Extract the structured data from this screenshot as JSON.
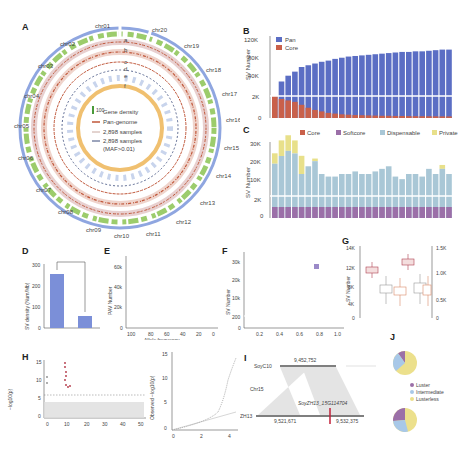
{
  "panels": {
    "A": {
      "label": "A",
      "chromosomes": [
        "chr01",
        "chr02",
        "chr03",
        "chr04",
        "chr05",
        "chr06",
        "chr07",
        "chr08",
        "chr09",
        "chr10",
        "chr11",
        "chr12",
        "chr13",
        "chr14",
        "chr15",
        "chr16",
        "chr17",
        "chr18",
        "chr19",
        "chr20"
      ],
      "track_labels": [
        "a",
        "b",
        "c",
        "d",
        "e",
        "f"
      ],
      "legend": [
        {
          "label": "Gene density",
          "scale_max": "100",
          "scale_min": "0"
        },
        {
          "label": "Pan-genome",
          "color": "#c0573a"
        },
        {
          "label": "2,898 samples",
          "color": "#c8a8a0"
        },
        {
          "label": "2,898 samples (MAF>0.01)",
          "color": "#3a4a7a"
        }
      ],
      "colors": {
        "outer_ring": "#8fa6e0",
        "gene_density": "#4a9a3a",
        "inner_ring": "#f0c070"
      }
    },
    "B": {
      "label": "B"
    },
    "C": {
      "label": "C"
    },
    "D": {
      "label": "D"
    },
    "E": {
      "label": "E"
    },
    "F": {
      "label": "F"
    },
    "G": {
      "label": "G"
    },
    "H": {
      "label": "H"
    },
    "I": {
      "label": "I",
      "top_genome": "SoyC10",
      "top_position": "9,452,752",
      "chr": "Chr15",
      "bottom_genome": "ZH13",
      "gene": "SoyZH13_15G114704",
      "bottom_start": "9,521,671",
      "bottom_end": "9,532,375"
    },
    "J": {
      "label": "J",
      "legend": [
        "Luster",
        "Intermediate",
        "Lusterless"
      ],
      "colors": [
        "#9b6fa8",
        "#a8c8e8",
        "#ece08c"
      ]
    }
  },
  "chart_data": [
    {
      "id": "B",
      "type": "bar",
      "title": "",
      "xlabel": "",
      "ylabel": "SV Number",
      "yticks": [
        "0",
        "2K",
        "40K",
        "80K",
        "120K"
      ],
      "legend": [
        "Pan",
        "Core"
      ],
      "colors": {
        "Pan": "#5b6ec4",
        "Core": "#c9604a"
      },
      "series": [
        {
          "name": "Pan",
          "values": [
            3,
            45,
            55,
            62,
            70,
            73,
            76,
            79,
            81,
            84,
            86,
            88,
            89,
            90,
            91,
            92,
            93,
            94,
            95,
            96,
            96,
            97,
            97,
            98,
            99,
            100,
            100
          ]
        },
        {
          "name": "Core",
          "values": [
            3,
            2.6,
            2.4,
            2.2,
            1.8,
            1.4,
            1.1,
            0.9,
            0.7,
            0.6,
            0.5,
            0.45,
            0.4,
            0.38,
            0.35,
            0.33,
            0.3,
            0.3,
            0.28,
            0.27,
            0.26,
            0.25,
            0.24,
            0.24,
            0.23,
            0.22,
            0.22
          ]
        }
      ],
      "note": "broken y-axis: 0-3K lower segment, 20K-120K upper segment; values in K"
    },
    {
      "id": "C",
      "type": "bar",
      "stacked": true,
      "ylabel": "SV Number",
      "yticks": [
        "0",
        "2K",
        "10K",
        "20K",
        "30K"
      ],
      "legend": [
        "Core",
        "Softcore",
        "Dispensable",
        "Private"
      ],
      "colors": {
        "Core": "#c9604a",
        "Softcore": "#9b6fa8",
        "Dispensable": "#a9c7d6",
        "Private": "#e8e08a"
      },
      "categories": [
        "SoyW01",
        "SoyW02",
        "SoyW03",
        "SoyW04",
        "SoyW05",
        "SoyL01",
        "SoyL02",
        "SoyL03",
        "SoyL04",
        "SoyL05",
        "SoyL06",
        "SoyL07",
        "SoyL08",
        "SoyL09",
        "SoyC01",
        "SoyC02",
        "SoyC03",
        "SoyC04",
        "SoyC05",
        "SoyC06",
        "SoyC07",
        "SoyC08",
        "SoyC09",
        "SoyC10",
        "SoyC11",
        "SoyC12",
        "SoyC13"
      ],
      "series": [
        {
          "name": "Dispensable+Softcore+Core (K)",
          "values": [
            20,
            23,
            25,
            24,
            16,
            19,
            21,
            16,
            15,
            15,
            16,
            16,
            17,
            16,
            16,
            17,
            18,
            19,
            15,
            14,
            16,
            16,
            15,
            18,
            16,
            18,
            16
          ]
        },
        {
          "name": "Private (K)",
          "values": [
            4,
            6,
            6,
            5,
            7,
            0,
            1,
            0,
            0,
            0,
            0,
            0,
            0,
            0,
            0,
            0,
            0,
            0,
            0,
            0,
            0,
            0,
            0,
            0,
            0,
            1.5,
            0
          ]
        }
      ]
    },
    {
      "id": "D",
      "type": "bar",
      "ylabel": "SV density (Num/Mb)",
      "categories": [
        "Repeat",
        "Non-repeat"
      ],
      "values": [
        255,
        55
      ],
      "yticks": [
        "0",
        "100",
        "200",
        "300"
      ],
      "annotation": "***",
      "color": "#7b8fd8"
    },
    {
      "id": "E",
      "type": "bar",
      "xlabel": "Repeat coverage (%)",
      "ylabel": "PAV Number",
      "xticks": [
        "100",
        "80",
        "60",
        "40",
        "20",
        "0"
      ],
      "yticks": [
        "0",
        "20k",
        "40k",
        "60k"
      ],
      "values_k": [
        65,
        3,
        1.5,
        1.5,
        1.5,
        1.5,
        1.5,
        1.5,
        1.5,
        1.5,
        1.5,
        1.5,
        1.5,
        1.5,
        1.5,
        2,
        2,
        2,
        2,
        2,
        2,
        22
      ]
    },
    {
      "id": "F",
      "type": "bar",
      "stacked": true,
      "xlabel": "Allele frequency",
      "ylabel": "SV Number",
      "xticks": [
        "0.2",
        "0.4",
        "0.6",
        "0.8",
        "1.0"
      ],
      "yticks": [
        "0",
        "200",
        "10k",
        "20k",
        "30k"
      ],
      "legend": [
        "Novel"
      ],
      "categories": [
        "0.1",
        "0.2",
        "0.3",
        "0.4",
        "0.5",
        "0.6",
        "0.7",
        "0.8",
        "0.9",
        "1.0"
      ],
      "series": [
        {
          "name": "Total",
          "values": [
            33000,
            6500,
            5000,
            4000,
            3000,
            2800,
            2700,
            2500,
            2400,
            2000
          ]
        },
        {
          "name": "Novel",
          "values": [
            20,
            20,
            25,
            30,
            40,
            45,
            60,
            80,
            110,
            90
          ]
        }
      ]
    },
    {
      "id": "G",
      "type": "box",
      "ylabel": "SV Number",
      "yticks_left": [
        "0",
        "4K",
        "8K",
        "12K",
        "14K"
      ],
      "yticks_right": [
        "0",
        "0.5K",
        "1.0K",
        "1.5K"
      ],
      "groups": [
        "Detected",
        "Novel"
      ],
      "categories": [
        "Soja",
        "Landrace",
        "Cultivar"
      ],
      "medians": {
        "Detected": [
          11500,
          7200,
          6800
        ],
        "Novel": [
          1250,
          780,
          730
        ]
      }
    },
    {
      "id": "H",
      "type": "scatter",
      "title": "",
      "xlabel": "Chromosome15 (Mb)",
      "ylabel": "-log10(p)",
      "xticks": [
        "0",
        "10",
        "20",
        "30",
        "40",
        "50"
      ],
      "yticks": [
        "0",
        "5",
        "10",
        "15"
      ],
      "threshold": 6,
      "peak_x": 10,
      "qq": {
        "xlabel": "Observed -log(p)",
        "ylabel": "Observed -log10(p)",
        "xticks": [
          "0",
          "2",
          "4"
        ],
        "yticks": [
          "0",
          "5",
          "10",
          "15"
        ]
      }
    },
    {
      "id": "J",
      "type": "pie",
      "pies": [
        {
          "name": "Hap2",
          "n": "n=525",
          "values": [
            10,
            15,
            75
          ]
        },
        {
          "name": "Hap1",
          "n": "n=229",
          "values": [
            35,
            35,
            30
          ]
        }
      ],
      "legend": [
        "Luster",
        "Intermediate",
        "Lusterless"
      ]
    }
  ]
}
